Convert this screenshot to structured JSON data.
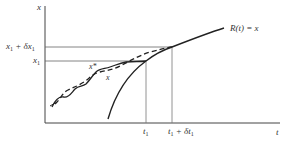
{
  "diagram": {
    "axes": {
      "y_label": "x",
      "x_label": "t"
    },
    "y_ticks": [
      {
        "label": "x1 + δx1",
        "main": "x",
        "sub": "1",
        "rest": " + δx",
        "sub2": "1"
      },
      {
        "label": "x1",
        "main": "x",
        "sub": "1"
      }
    ],
    "x_ticks": [
      {
        "label": "t1",
        "main": "t",
        "sub": "1"
      },
      {
        "label": "t1 + δt1",
        "main": "t",
        "sub": "1",
        "rest": " + δt",
        "sub2": "1"
      }
    ],
    "curves": [
      {
        "name": "R(t) = x",
        "label": "R(t) =  x",
        "style": "solid"
      },
      {
        "name": "x*",
        "label": "x*",
        "style": "solid-wavy"
      },
      {
        "name": "x",
        "label": "x",
        "style": "dashed"
      }
    ],
    "colors": {
      "ink": "#222222",
      "guide": "#777777",
      "background": "#ffffff"
    }
  }
}
